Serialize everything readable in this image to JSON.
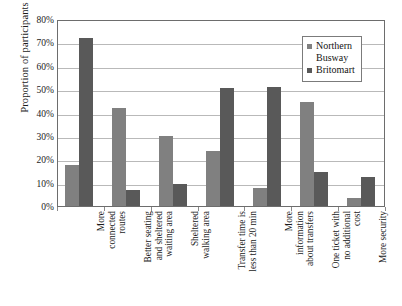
{
  "chart_data": {
    "type": "bar",
    "title": "",
    "subtitle": "",
    "xlabel": "",
    "ylabel": "Proportion of participants",
    "ylim": [
      0,
      80
    ],
    "y_tick_labels": [
      "80%",
      "70%",
      "60%",
      "50%",
      "40%",
      "30%",
      "20%",
      "10%",
      "0%"
    ],
    "y_tick_values": [
      80,
      70,
      60,
      50,
      40,
      30,
      20,
      10,
      0
    ],
    "grid": true,
    "legend_position": "top-right-inside",
    "value_unit": "%",
    "categories": [
      "More connected routes",
      "Better seating and sheltered waiting area",
      "Sheltered walking area",
      "Transfer time is less than 20 min",
      "More information about transfers",
      "One ticket with no additional cost",
      "More security"
    ],
    "category_lines": [
      [
        "More",
        "connected",
        "routes"
      ],
      [
        "Better seating",
        "and sheltered",
        "waiting area"
      ],
      [
        "Sheltered",
        "walking area"
      ],
      [
        "Transfer time is",
        "less than 20 min"
      ],
      [
        "More",
        "information",
        "about transfers"
      ],
      [
        "One ticket with",
        "no additional",
        "cost"
      ],
      [
        "More security"
      ]
    ],
    "series": [
      {
        "name": "Northern Busway",
        "legend_label": "Northern\nBusway",
        "color": "#808080",
        "values": [
          17.5,
          42.0,
          30.0,
          23.5,
          7.7,
          44.5,
          3.3
        ]
      },
      {
        "name": "Britomart",
        "legend_label": "Britomart",
        "color": "#595959",
        "values": [
          72.0,
          7.0,
          9.5,
          50.5,
          51.0,
          14.7,
          12.2
        ]
      }
    ]
  },
  "colors": {
    "series_northern_busway": "#808080",
    "series_britomart": "#595959",
    "gridline": "#b9b9b9",
    "plot_border": "#6d6d6d",
    "background": "#ffffff",
    "text": "#1b1b1b"
  }
}
